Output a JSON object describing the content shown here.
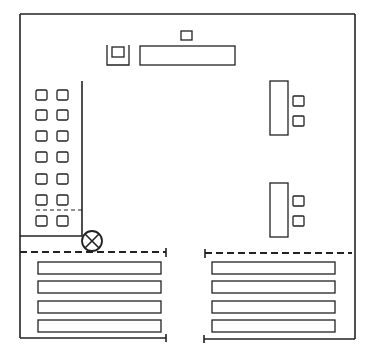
{
  "diagram": {
    "type": "floor-plan",
    "stroke_color": "#222222",
    "background": "#ffffff",
    "outer_wall": {
      "x1": 20,
      "y1": 14,
      "x2": 355,
      "y2": 339
    },
    "top_objects": {
      "small_square": {
        "x": 181,
        "y": 31,
        "w": 11,
        "h": 9
      },
      "u_enclosure": {
        "x": 107,
        "y": 45,
        "w": 22,
        "h": 20
      },
      "u_inner_square": {
        "x": 112,
        "y": 47,
        "w": 12,
        "h": 10
      },
      "long_desk": {
        "x": 140,
        "y": 46,
        "w": 95,
        "h": 19
      }
    },
    "left_seat_grid": {
      "columns_x": [
        36,
        57
      ],
      "rows_y": [
        90,
        110,
        131,
        152,
        174,
        195,
        216
      ],
      "seat_w": 11,
      "seat_h": 10
    },
    "left_partition": {
      "vertical_x": 82,
      "top_y": 81,
      "bottom_y": 236,
      "dashed_y": 210
    },
    "symbol": {
      "name": "circle-x",
      "cx": 92,
      "cy": 241,
      "r": 10
    },
    "right_desks": [
      {
        "desk": {
          "x": 270,
          "y": 81,
          "w": 18,
          "h": 54
        },
        "seats_y": [
          96,
          116
        ]
      },
      {
        "desk": {
          "x": 270,
          "y": 183,
          "w": 18,
          "h": 54
        },
        "seats_y": [
          196,
          216
        ]
      }
    ],
    "right_seat_x": 293,
    "dashed_lines": [
      {
        "x1": 20,
        "x2": 166,
        "y": 252
      },
      {
        "x1": 205,
        "x2": 352,
        "y": 253
      }
    ],
    "bottom_bars": {
      "left_x": 38,
      "right_x": 212,
      "w": 123,
      "h": 12,
      "rows_y": [
        262,
        281,
        301,
        320
      ]
    },
    "bottom_wall": {
      "left_end_x": 166,
      "right_start_x": 204,
      "y": 338
    }
  }
}
